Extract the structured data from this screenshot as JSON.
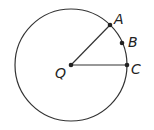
{
  "diagram": {
    "type": "circle-geometry",
    "circle": {
      "center_label": "Q",
      "cx": 71,
      "cy": 65,
      "r": 56
    },
    "points": [
      {
        "label": "A",
        "x": 110,
        "y": 25
      },
      {
        "label": "B",
        "x": 122,
        "y": 43
      },
      {
        "label": "C",
        "x": 127,
        "y": 65
      },
      {
        "label": "Q",
        "x": 71,
        "y": 65
      }
    ],
    "segments": [
      [
        "Q",
        "A"
      ],
      [
        "Q",
        "C"
      ]
    ],
    "colors": {
      "stroke": "#333333",
      "background": "#ffffff"
    }
  }
}
